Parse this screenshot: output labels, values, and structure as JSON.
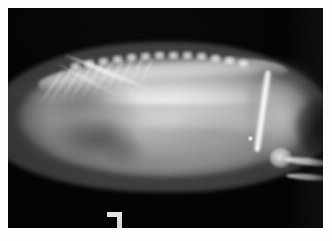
{
  "image": {
    "type": "radiograph",
    "modality": "X-ray",
    "view": "lateral",
    "subject": "small animal abdomen and thorax",
    "caption": ""
  },
  "film": {
    "border_color": "#fdfdfd",
    "background_color": "#050505",
    "plate_left": 8,
    "plate_top": 8,
    "plate_width": 315,
    "plate_height": 220
  },
  "marker": {
    "name": "radiographic-positioning-marker",
    "glyph": "¬",
    "color": "#fbfbfb",
    "x": 99,
    "y": 204,
    "width": 15,
    "height": 16
  },
  "anatomy": {
    "regions": [
      {
        "name": "dorsal-spine",
        "label": "Vertebral column"
      },
      {
        "name": "rib-cage",
        "label": "Ribs"
      },
      {
        "name": "thorax",
        "label": "Thoracic cavity"
      },
      {
        "name": "lung-field",
        "label": "Lung field"
      },
      {
        "name": "abdomen",
        "label": "Abdominal soft tissue"
      },
      {
        "name": "hind-limb",
        "label": "Hind limb"
      },
      {
        "name": "stifle-joint",
        "label": "Stifle joint"
      },
      {
        "name": "femur",
        "label": "Femur"
      },
      {
        "name": "tibia",
        "label": "Tibia / fibula"
      }
    ]
  },
  "palette": {
    "air": "#050505",
    "soft_tissue_mid": "#9a9a9a",
    "soft_tissue_bright": "#cfcfcf",
    "bone": "#f5f5f5",
    "border": "#fdfdfd"
  },
  "annotations": []
}
